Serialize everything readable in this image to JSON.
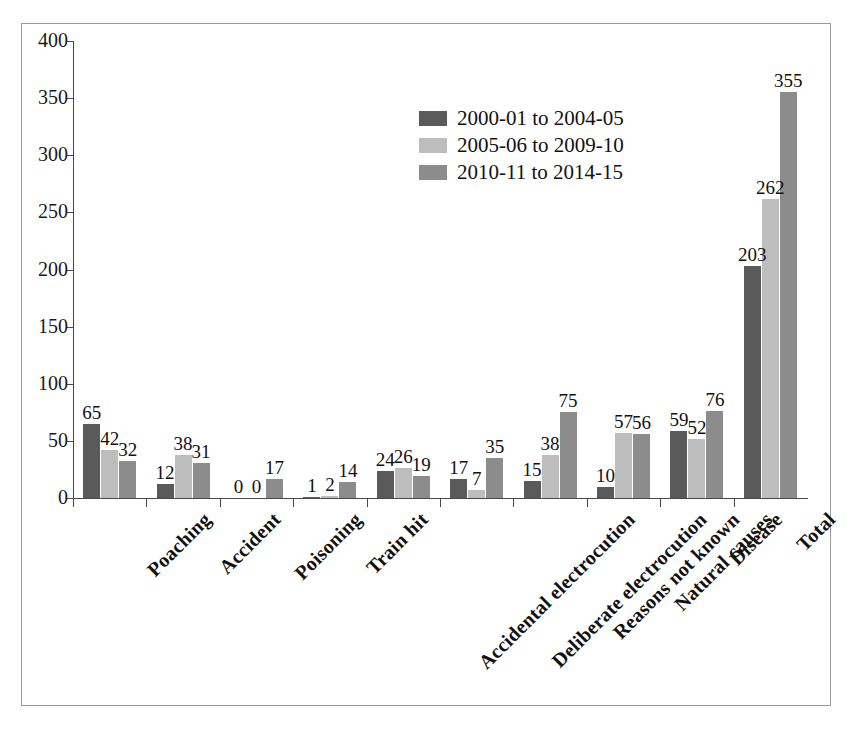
{
  "chart_data": {
    "type": "bar",
    "title": "",
    "subtitle": "",
    "xlabel": "",
    "ylabel": "",
    "ylim": [
      0,
      400
    ],
    "ytick_step": 50,
    "yticks": [
      400,
      350,
      300,
      250,
      200,
      150,
      100,
      50,
      0
    ],
    "grid": false,
    "legend_position": "inside-top-center",
    "orientation": "vertical",
    "grouped": true,
    "show_value_labels": true,
    "categories": [
      "Poaching",
      "Accident",
      "Poisoning",
      "Train hit",
      "Accidental electrocution",
      "Deliberate electrocution",
      "Reasons not known",
      "Natural causes",
      "Disease",
      "Total"
    ],
    "series": [
      {
        "name": "2000-01 to 2004-05",
        "color": "#5a5a5a",
        "values": [
          65,
          12,
          0,
          1,
          24,
          17,
          15,
          10,
          59,
          203
        ]
      },
      {
        "name": "2005-06 to 2009-10",
        "color": "#bdbdbd",
        "values": [
          42,
          38,
          0,
          2,
          26,
          7,
          38,
          57,
          52,
          262
        ]
      },
      {
        "name": "2010-11 to 2014-15",
        "color": "#8c8c8c",
        "values": [
          32,
          31,
          17,
          14,
          19,
          35,
          75,
          56,
          76,
          355
        ]
      }
    ]
  },
  "legend": {
    "items": [
      {
        "label": "2000-01 to 2004-05",
        "color": "#5a5a5a"
      },
      {
        "label": "2005-06 to 2009-10",
        "color": "#bdbdbd"
      },
      {
        "label": "2010-11 to 2014-15",
        "color": "#8c8c8c"
      }
    ]
  }
}
